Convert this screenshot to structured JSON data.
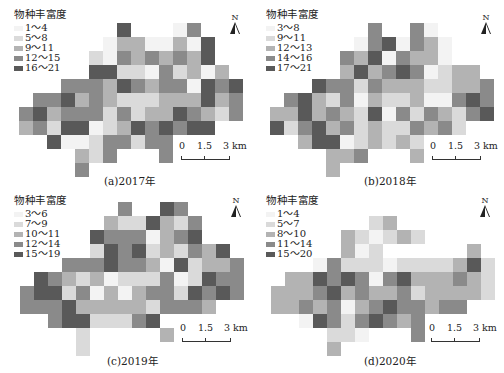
{
  "legend_title": "物种丰富度",
  "colors": {
    "1": "#f3f3f3",
    "2": "#dadada",
    "3": "#b3b3b3",
    "4": "#8a8a8a",
    "5": "#595959"
  },
  "north_label": "N",
  "scale": {
    "l0": "0",
    "l1": "1.5",
    "l2": "3 km"
  },
  "panels": [
    {
      "caption": "(a)2017年",
      "legend": [
        "1～4",
        "5～8",
        "9～11",
        "12～15",
        "16～21"
      ]
    },
    {
      "caption": "(b)2018年",
      "legend": [
        "3～8",
        "9～11",
        "12～13",
        "14～16",
        "17～21"
      ]
    },
    {
      "caption": "(c)2019年",
      "legend": [
        "3～6",
        "7～9",
        "10～11",
        "12～14",
        "15～19"
      ]
    },
    {
      "caption": "(d)2020年",
      "legend": [
        "1～4",
        "5～7",
        "8～10",
        "11～14",
        "15～20"
      ]
    }
  ],
  "chart_data": [
    {
      "type": "heatmap",
      "title": "(a)2017年",
      "legend_title": "物种丰富度",
      "classes": [
        "1～4",
        "5～8",
        "9～11",
        "12～15",
        "16～21"
      ],
      "grid": [
        [
          0,
          0,
          0,
          0,
          0,
          0,
          0,
          5,
          0,
          0,
          0,
          1,
          4,
          0,
          0,
          0
        ],
        [
          0,
          0,
          0,
          0,
          0,
          0,
          1,
          3,
          3,
          1,
          1,
          3,
          1,
          5,
          0,
          0
        ],
        [
          0,
          0,
          0,
          0,
          0,
          2,
          1,
          4,
          3,
          4,
          3,
          4,
          3,
          5,
          0,
          0
        ],
        [
          0,
          0,
          0,
          0,
          0,
          5,
          5,
          2,
          2,
          1,
          4,
          2,
          3,
          1,
          3,
          0
        ],
        [
          0,
          0,
          0,
          4,
          4,
          4,
          3,
          5,
          4,
          3,
          4,
          4,
          1,
          5,
          4,
          5
        ],
        [
          0,
          4,
          4,
          5,
          3,
          4,
          3,
          2,
          2,
          2,
          3,
          3,
          3,
          5,
          3,
          4
        ],
        [
          4,
          5,
          3,
          4,
          4,
          4,
          2,
          4,
          2,
          3,
          3,
          5,
          4,
          3,
          2,
          4
        ],
        [
          3,
          4,
          2,
          5,
          5,
          1,
          2,
          3,
          5,
          4,
          5,
          4,
          5,
          5,
          0,
          0
        ],
        [
          0,
          0,
          5,
          1,
          1,
          2,
          4,
          4,
          2,
          4,
          4,
          0,
          0,
          0,
          0,
          0
        ],
        [
          0,
          0,
          0,
          0,
          3,
          2,
          4,
          0,
          0,
          0,
          4,
          0,
          0,
          0,
          0,
          0
        ],
        [
          0,
          0,
          0,
          0,
          4,
          0,
          0,
          0,
          0,
          0,
          0,
          0,
          0,
          0,
          0,
          0
        ]
      ]
    },
    {
      "type": "heatmap",
      "title": "(b)2018年",
      "legend_title": "物种丰富度",
      "classes": [
        "3～8",
        "9～11",
        "12～13",
        "14～16",
        "17～21"
      ],
      "grid": [
        [
          0,
          0,
          0,
          0,
          0,
          0,
          0,
          4,
          0,
          0,
          4,
          1,
          0,
          0,
          0,
          0
        ],
        [
          0,
          0,
          0,
          0,
          0,
          0,
          1,
          4,
          5,
          1,
          4,
          3,
          1,
          0,
          0,
          0
        ],
        [
          0,
          0,
          0,
          0,
          0,
          4,
          3,
          5,
          1,
          4,
          3,
          3,
          1,
          0,
          0,
          0
        ],
        [
          0,
          0,
          0,
          0,
          0,
          3,
          5,
          3,
          4,
          5,
          4,
          1,
          2,
          3,
          3,
          0
        ],
        [
          0,
          0,
          0,
          5,
          4,
          4,
          2,
          4,
          3,
          3,
          3,
          2,
          2,
          3,
          3,
          4
        ],
        [
          0,
          4,
          5,
          3,
          2,
          4,
          1,
          3,
          2,
          2,
          3,
          1,
          1,
          4,
          5,
          4
        ],
        [
          3,
          3,
          5,
          3,
          4,
          3,
          2,
          5,
          1,
          4,
          2,
          4,
          3,
          2,
          4,
          5
        ],
        [
          5,
          2,
          4,
          5,
          3,
          4,
          2,
          3,
          2,
          2,
          4,
          3,
          4,
          2,
          0,
          0
        ],
        [
          0,
          0,
          3,
          5,
          5,
          1,
          2,
          3,
          2,
          3,
          2,
          0,
          0,
          0,
          0,
          0
        ],
        [
          0,
          0,
          0,
          0,
          3,
          3,
          4,
          0,
          0,
          0,
          3,
          0,
          0,
          0,
          0,
          0
        ],
        [
          0,
          0,
          0,
          0,
          3,
          0,
          0,
          0,
          0,
          0,
          0,
          0,
          0,
          0,
          0,
          0
        ]
      ]
    },
    {
      "type": "heatmap",
      "title": "(c)2019年",
      "legend_title": "物种丰富度",
      "classes": [
        "3～6",
        "7～9",
        "10～11",
        "12～14",
        "15～19"
      ],
      "grid": [
        [
          0,
          0,
          0,
          0,
          0,
          0,
          0,
          4,
          0,
          0,
          5,
          4,
          0,
          0,
          0,
          0
        ],
        [
          0,
          0,
          0,
          0,
          0,
          0,
          3,
          2,
          2,
          5,
          3,
          2,
          4,
          0,
          0,
          0
        ],
        [
          0,
          0,
          0,
          0,
          0,
          5,
          4,
          4,
          4,
          1,
          3,
          4,
          5,
          0,
          0,
          0
        ],
        [
          0,
          0,
          0,
          0,
          0,
          2,
          5,
          4,
          5,
          2,
          3,
          2,
          4,
          3,
          5,
          0
        ],
        [
          0,
          0,
          0,
          4,
          4,
          4,
          5,
          4,
          4,
          3,
          1,
          5,
          2,
          3,
          3,
          4
        ],
        [
          0,
          5,
          4,
          3,
          2,
          3,
          1,
          2,
          2,
          2,
          4,
          1,
          2,
          5,
          4,
          4
        ],
        [
          4,
          5,
          5,
          2,
          4,
          1,
          3,
          1,
          3,
          4,
          4,
          2,
          5,
          4,
          5,
          4
        ],
        [
          4,
          4,
          4,
          5,
          3,
          3,
          3,
          3,
          3,
          2,
          4,
          4,
          4,
          3,
          0,
          0
        ],
        [
          0,
          0,
          4,
          5,
          5,
          2,
          2,
          2,
          4,
          5,
          0,
          0,
          0,
          0,
          0,
          0
        ],
        [
          0,
          0,
          0,
          0,
          2,
          0,
          0,
          0,
          0,
          0,
          3,
          0,
          0,
          0,
          0,
          0
        ],
        [
          0,
          0,
          0,
          0,
          2,
          0,
          0,
          0,
          0,
          0,
          0,
          0,
          0,
          0,
          0,
          0
        ]
      ]
    },
    {
      "type": "heatmap",
      "title": "(d)2020年",
      "legend_title": "物种丰富度",
      "classes": [
        "1～4",
        "5～7",
        "8～10",
        "11～14",
        "15～20"
      ],
      "grid": [
        [
          0,
          0,
          0,
          0,
          0,
          0,
          0,
          0,
          0,
          0,
          0,
          0,
          0,
          0,
          0,
          0
        ],
        [
          0,
          0,
          0,
          0,
          0,
          0,
          0,
          2,
          3,
          0,
          0,
          0,
          0,
          0,
          0,
          0
        ],
        [
          0,
          0,
          0,
          0,
          0,
          3,
          2,
          1,
          2,
          3,
          2,
          0,
          0,
          0,
          0,
          0
        ],
        [
          0,
          0,
          0,
          0,
          0,
          3,
          1,
          2,
          0,
          0,
          0,
          0,
          0,
          0,
          3,
          0
        ],
        [
          0,
          0,
          0,
          1,
          4,
          2,
          2,
          2,
          1,
          2,
          2,
          2,
          2,
          3,
          5,
          2
        ],
        [
          0,
          3,
          3,
          5,
          4,
          5,
          4,
          1,
          4,
          5,
          3,
          3,
          3,
          4,
          3,
          2
        ],
        [
          3,
          3,
          3,
          4,
          5,
          3,
          4,
          3,
          3,
          4,
          2,
          3,
          3,
          3,
          3,
          2
        ],
        [
          3,
          3,
          4,
          3,
          4,
          1,
          3,
          4,
          5,
          4,
          4,
          3,
          4,
          4,
          0,
          0
        ],
        [
          0,
          0,
          1,
          5,
          4,
          2,
          4,
          5,
          4,
          3,
          4,
          0,
          0,
          0,
          0,
          0
        ],
        [
          0,
          0,
          0,
          0,
          2,
          2,
          1,
          0,
          0,
          0,
          4,
          0,
          0,
          0,
          0,
          0
        ],
        [
          0,
          0,
          0,
          0,
          3,
          0,
          0,
          0,
          0,
          0,
          0,
          0,
          0,
          0,
          0,
          0
        ]
      ]
    }
  ]
}
